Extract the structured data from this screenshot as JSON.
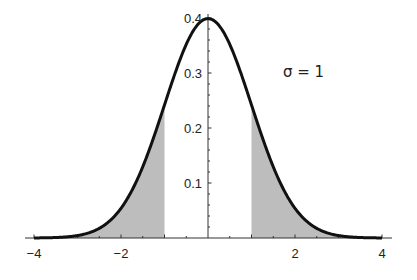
{
  "chart_data": {
    "type": "area",
    "title": "",
    "xlabel": "",
    "ylabel": "",
    "series": [
      {
        "name": "Normal density (mu=0, sigma=1)",
        "function": "pdf",
        "mu": 0,
        "sigma": 1
      }
    ],
    "shaded_regions": [
      {
        "from": -4,
        "to": -1
      },
      {
        "from": 1,
        "to": 4
      }
    ],
    "x": [
      -4,
      -3,
      -2,
      -1,
      0,
      1,
      2,
      3,
      4
    ],
    "values": [
      0.0001,
      0.0044,
      0.054,
      0.242,
      0.399,
      0.242,
      0.054,
      0.0044,
      0.0001
    ],
    "xlim": [
      -4,
      4
    ],
    "ylim": [
      0,
      0.4
    ],
    "x_tick_labels": [
      "−4",
      "−2",
      "2",
      "4"
    ],
    "x_ticks": [
      -4,
      -2,
      2,
      4
    ],
    "y_tick_labels": [
      "0.1",
      "0.2",
      "0.3",
      "0.4"
    ],
    "y_ticks": [
      0.1,
      0.2,
      0.3,
      0.4
    ],
    "annotations": [
      {
        "text": "σ = 1",
        "x": 2.0,
        "y": 0.3
      }
    ],
    "grid": false,
    "legend": "none",
    "colors": {
      "curve": "#111111",
      "shade": "#bdbdbd",
      "axis": "#333333"
    }
  }
}
